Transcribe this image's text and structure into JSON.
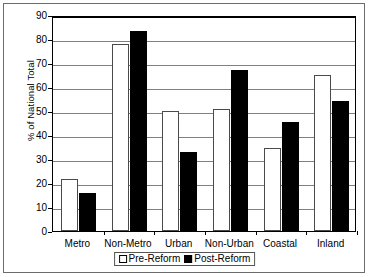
{
  "chart_data": {
    "type": "bar",
    "title": "",
    "xlabel": "",
    "ylabel": "% of National Total",
    "ylim": [
      0,
      90
    ],
    "ytick_step": 10,
    "yticks": [
      "0",
      "10",
      "20",
      "30",
      "40",
      "50",
      "60",
      "70",
      "80",
      "90"
    ],
    "grid": true,
    "legend_position": "bottom",
    "categories": [
      "Metro",
      "Non-Metro",
      "Urban",
      "Non-Urban",
      "Coastal",
      "Inland"
    ],
    "series": [
      {
        "name": "Pre-Reform",
        "swatch": "white-square",
        "color": "#ffffff",
        "values": [
          21.5,
          78,
          50,
          51,
          34.5,
          65
        ]
      },
      {
        "name": "Post-Reform",
        "swatch": "black-square",
        "color": "#000000",
        "values": [
          16,
          83.5,
          33,
          67,
          45.5,
          54
        ]
      }
    ]
  },
  "axis": {
    "y_title": "% of National Total"
  },
  "legend": {
    "items": [
      {
        "label": "Pre-Reform"
      },
      {
        "label": "Post-Reform"
      }
    ]
  }
}
